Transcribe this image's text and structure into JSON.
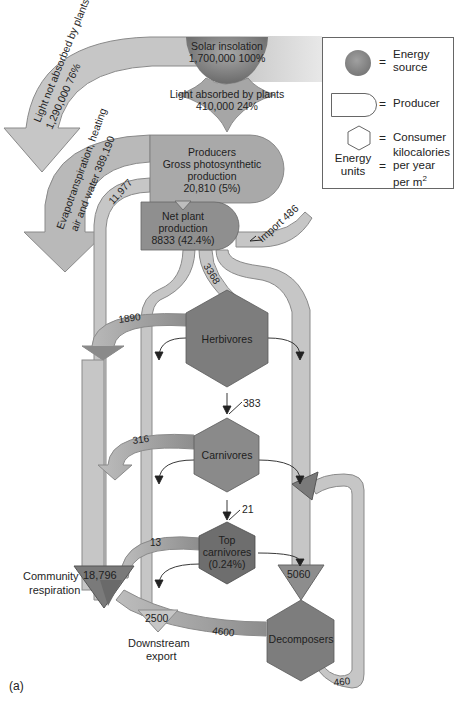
{
  "diagram": {
    "type": "energy-flow",
    "caption": "(a)",
    "nodes": {
      "solar": {
        "label": "Solar insolation",
        "value": "1,700,000  100%"
      },
      "absorbed": {
        "label": "Light absorbed by plants",
        "value": "410,000  24%"
      },
      "producers": {
        "line1": "Producers",
        "line2": "Gross photosynthetic",
        "line3": "production",
        "value": "20,810 (5%)"
      },
      "net_plant": {
        "line1": "Net plant",
        "line2": "production",
        "value": "8833 (42.4%)"
      },
      "herbivores": {
        "label": "Herbivores"
      },
      "carnivores": {
        "label": "Carnivores"
      },
      "top_carnivores": {
        "line1": "Top",
        "line2": "carnivores",
        "value": "(0.24%)"
      },
      "decomposers": {
        "label": "Decomposers"
      },
      "community_respiration": {
        "line1": "Community",
        "line2": "respiration",
        "value": "18,796"
      },
      "downstream_export": {
        "line1": "Downstream",
        "line2": "export",
        "value": "2500"
      },
      "decomposer_input": {
        "value": "5060"
      }
    },
    "flows": {
      "light_not_absorbed": {
        "line1": "Light not absorbed by plants",
        "line2": "1,290,000  76%"
      },
      "evapotranspiration": {
        "line1": "Evapotranspiration, heating",
        "line2": "air and water 389,190"
      },
      "producer_respiration": "11,977",
      "import": "Import 486",
      "to_herbivores": "3368",
      "herbivore_respiration": "1890",
      "to_carnivores": "383",
      "carnivore_respiration": "316",
      "to_top_carnivores": "21",
      "top_carnivore_respiration": "13",
      "decomposer_respiration": "4600",
      "decomposer_recycle": "460"
    }
  },
  "legend": {
    "items": [
      {
        "symbol": "circle",
        "label_line1": "Energy",
        "label_line2": "source"
      },
      {
        "symbol": "rounded-rect",
        "label_line1": "Producer"
      },
      {
        "symbol": "hexagon",
        "label_line1": "Consumer"
      }
    ],
    "units": {
      "label_line1": "Energy",
      "label_line2": "units",
      "value_line1": "kilocalories",
      "value_line2": "per year",
      "value_line3": "per m",
      "value_sup": "2"
    },
    "equals": "="
  },
  "colors": {
    "band": "#c4c4c4",
    "band_edge": "#8a8a8a",
    "producer": "#a9a9a9",
    "net_plant": "#8f8f8f",
    "consumer": "#7d7d7d",
    "top_consumer": "#6e6e6e",
    "source": "#8a8a8a"
  }
}
